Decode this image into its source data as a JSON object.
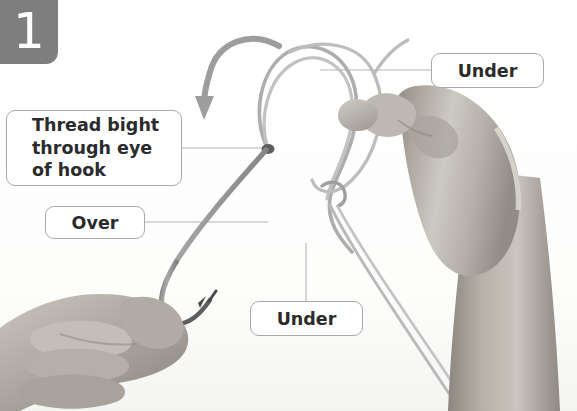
{
  "figure": {
    "kind": "illustrated-instruction-step",
    "background_color": "#ffffff"
  },
  "step_badge": {
    "number": "1",
    "background_color": "#7e7e7e",
    "text_color": "#ffffff"
  },
  "callouts": [
    {
      "id": "thread-bight",
      "text": "Thread bight\nthrough eye\nof hook",
      "border_color": "#a9a9a9",
      "text_color": "#2b2b2b"
    },
    {
      "id": "over",
      "text": "Over",
      "border_color": "#a9a9a9",
      "text_color": "#2b2b2b"
    },
    {
      "id": "under-top",
      "text": "Under",
      "border_color": "#a9a9a9",
      "text_color": "#2b2b2b"
    },
    {
      "id": "under-bottom",
      "text": "Under",
      "border_color": "#a9a9a9",
      "text_color": "#2b2b2b"
    }
  ],
  "photo": {
    "palette": {
      "line": "#a3a3a3",
      "line_dark": "#8a8a8a",
      "hook_metal": "#8d8d8d",
      "hook_metal_dark": "#5d5d5d",
      "arrow": "#9a9a9a",
      "leader_line": "#b4b4b4",
      "skin_light": "#d6d3cf",
      "skin_mid": "#b9b5b1",
      "skin_dark": "#9a9691",
      "skin_shadow": "#848078",
      "backdrop": "#fbfbfa"
    },
    "elements": [
      "right-hand-pinching-line",
      "left-hand-holding-hook",
      "fishing-hook",
      "monofilament-line-bight",
      "curved-direction-arrow"
    ]
  }
}
